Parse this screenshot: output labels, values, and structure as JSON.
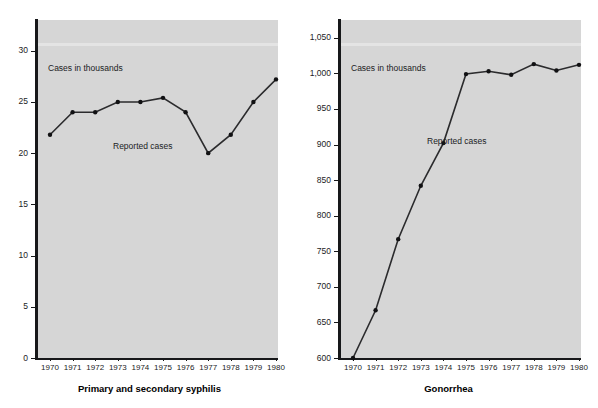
{
  "figure": {
    "background_color": "#ffffff",
    "plot_fill": "#d6d6d6",
    "ink_color": "#17181a"
  },
  "chart_data": [
    {
      "type": "line",
      "title": "Primary and secondary syphilis",
      "axis_note": "Cases in thousands",
      "series_label": "Reported cases",
      "xlabel": "",
      "ylabel": "Cases in thousands",
      "x": [
        "1970",
        "1971",
        "1972",
        "1973",
        "1974",
        "1975",
        "1976",
        "1977",
        "1978",
        "1979",
        "1980"
      ],
      "categories": [
        "1970",
        "1971",
        "1972",
        "1973",
        "1974",
        "1975",
        "1976",
        "1977",
        "1978",
        "1979",
        "1980"
      ],
      "values": [
        21.8,
        24.0,
        24.0,
        25.0,
        25.0,
        25.4,
        24.0,
        20.0,
        21.8,
        25.0,
        27.2
      ],
      "series": [
        {
          "name": "Reported cases",
          "values": [
            21.8,
            24.0,
            24.0,
            25.0,
            25.0,
            25.4,
            24.0,
            20.0,
            21.8,
            25.0,
            27.2
          ]
        }
      ],
      "yticks": [
        0,
        5,
        10,
        15,
        20,
        25,
        30
      ],
      "ytick_labels": [
        "0",
        "5",
        "10",
        "15",
        "20",
        "25",
        "30"
      ],
      "ylim": [
        0,
        33
      ],
      "grid": false,
      "legend": "none",
      "marker": "filled-circle"
    },
    {
      "type": "line",
      "title": "Gonorrhea",
      "axis_note": "Cases in thousands",
      "series_label": "Reported cases",
      "xlabel": "",
      "ylabel": "Cases in thousands",
      "x": [
        "1970",
        "1971",
        "1972",
        "1973",
        "1974",
        "1975",
        "1976",
        "1977",
        "1978",
        "1979",
        "1980"
      ],
      "categories": [
        "1970",
        "1971",
        "1972",
        "1973",
        "1974",
        "1975",
        "1976",
        "1977",
        "1978",
        "1979",
        "1980"
      ],
      "values": [
        600,
        667,
        767,
        842,
        902,
        999,
        1003,
        998,
        1013,
        1004,
        1012
      ],
      "series": [
        {
          "name": "Reported cases",
          "values": [
            600,
            667,
            767,
            842,
            902,
            999,
            1003,
            998,
            1013,
            1004,
            1012
          ]
        }
      ],
      "yticks": [
        600,
        650,
        700,
        750,
        800,
        850,
        900,
        950,
        1000,
        1050
      ],
      "ytick_labels": [
        "600",
        "650",
        "700",
        "750",
        "800",
        "850",
        "900",
        "950",
        "1,000",
        "1,050"
      ],
      "ylim": [
        600,
        1075
      ],
      "grid": false,
      "legend": "none",
      "marker": "filled-circle"
    }
  ],
  "left_chart": {
    "caption": "Primary and secondary syphilis",
    "units_note": "Cases in thousands",
    "series_note": "Reported cases"
  },
  "right_chart": {
    "caption": "Gonorrhea",
    "units_note": "Cases in thousands",
    "series_note": "Reported cases"
  }
}
